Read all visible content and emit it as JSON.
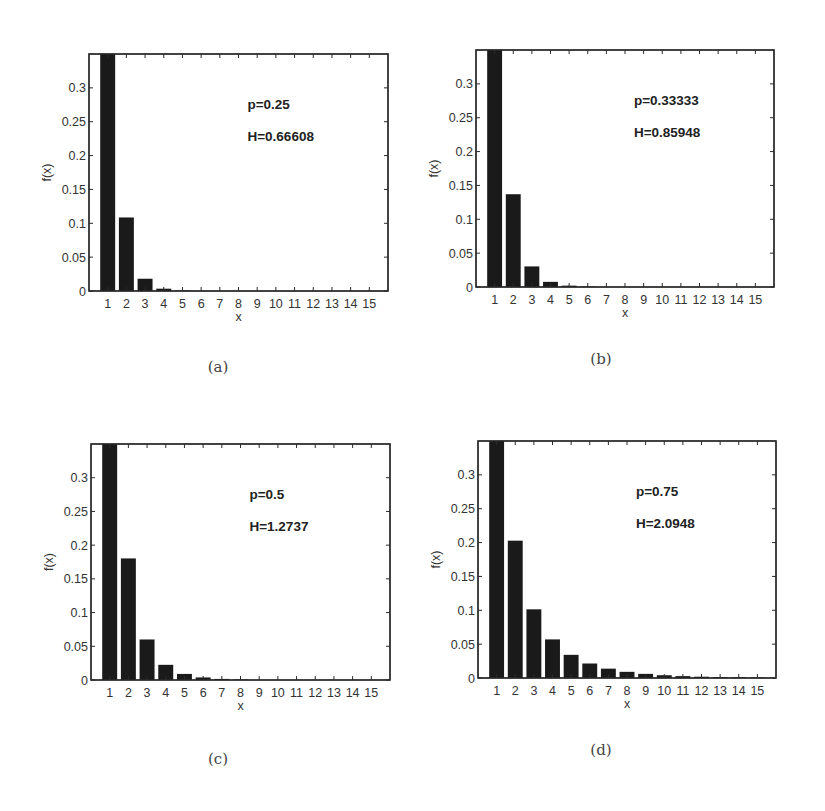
{
  "figure": {
    "captions": [
      "(a)",
      "(b)",
      "(c)",
      "(d)"
    ]
  },
  "chart_data": [
    {
      "type": "bar",
      "panel": "(a)",
      "title": "",
      "xlabel": "x",
      "ylabel": "f(x)",
      "categories": [
        1,
        2,
        3,
        4,
        5,
        6,
        7,
        8,
        9,
        10,
        11,
        12,
        13,
        14,
        15
      ],
      "values": [
        0.869,
        0.1086,
        0.0181,
        0.0034,
        0.0007,
        0.0001,
        0.0,
        0.0,
        0.0,
        0.0,
        0.0,
        0.0,
        0.0,
        0.0,
        0.0
      ],
      "ylim": [
        0,
        0.35
      ],
      "yticks": [
        0,
        0.05,
        0.1,
        0.15,
        0.2,
        0.25,
        0.3
      ],
      "ytick_labels": [
        "0",
        "0.05",
        "0.1",
        "0.15",
        "0.2",
        "0.25",
        "0.3"
      ],
      "annotations": [
        "p=0.25",
        "H=0.66608"
      ],
      "grid": false,
      "legend": null
    },
    {
      "type": "bar",
      "panel": "(b)",
      "title": "",
      "xlabel": "x",
      "ylabel": "f(x)",
      "categories": [
        1,
        2,
        3,
        4,
        5,
        6,
        7,
        8,
        9,
        10,
        11,
        12,
        13,
        14,
        15
      ],
      "values": [
        0.8221,
        0.137,
        0.0304,
        0.0076,
        0.002,
        0.0006,
        0.0002,
        0.0001,
        0.0,
        0.0,
        0.0,
        0.0,
        0.0,
        0.0,
        0.0
      ],
      "ylim": [
        0,
        0.35
      ],
      "yticks": [
        0,
        0.05,
        0.1,
        0.15,
        0.2,
        0.25,
        0.3
      ],
      "ytick_labels": [
        "0",
        "0.05",
        "0.1",
        "0.15",
        "0.2",
        "0.25",
        "0.3"
      ],
      "annotations": [
        "p=0.33333",
        "H=0.85948"
      ],
      "grid": false,
      "legend": null
    },
    {
      "type": "bar",
      "panel": "(c)",
      "title": "",
      "xlabel": "x",
      "ylabel": "f(x)",
      "categories": [
        1,
        2,
        3,
        4,
        5,
        6,
        7,
        8,
        9,
        10,
        11,
        12,
        13,
        14,
        15
      ],
      "values": [
        0.7213,
        0.1803,
        0.0601,
        0.0225,
        0.009,
        0.0038,
        0.0016,
        0.0007,
        0.0003,
        0.0001,
        0.0001,
        0.0,
        0.0,
        0.0,
        0.0
      ],
      "ylim": [
        0,
        0.35
      ],
      "yticks": [
        0,
        0.05,
        0.1,
        0.15,
        0.2,
        0.25,
        0.3
      ],
      "ytick_labels": [
        "0",
        "0.05",
        "0.1",
        "0.15",
        "0.2",
        "0.25",
        "0.3"
      ],
      "annotations": [
        "p=0.5",
        "H=1.2737"
      ],
      "grid": false,
      "legend": null
    },
    {
      "type": "bar",
      "panel": "(d)",
      "title": "",
      "xlabel": "x",
      "ylabel": "f(x)",
      "categories": [
        1,
        2,
        3,
        4,
        5,
        6,
        7,
        8,
        9,
        10,
        11,
        12,
        13,
        14,
        15
      ],
      "values": [
        0.541,
        0.2028,
        0.1014,
        0.057,
        0.0342,
        0.0214,
        0.0138,
        0.0091,
        0.0061,
        0.0041,
        0.0028,
        0.0019,
        0.0013,
        0.0009,
        0.0006
      ],
      "ylim": [
        0,
        0.35
      ],
      "yticks": [
        0,
        0.05,
        0.1,
        0.15,
        0.2,
        0.25,
        0.3
      ],
      "ytick_labels": [
        "0",
        "0.05",
        "0.1",
        "0.15",
        "0.2",
        "0.25",
        "0.3"
      ],
      "annotations": [
        "p=0.75",
        "H=2.0948"
      ],
      "grid": false,
      "legend": null
    }
  ]
}
